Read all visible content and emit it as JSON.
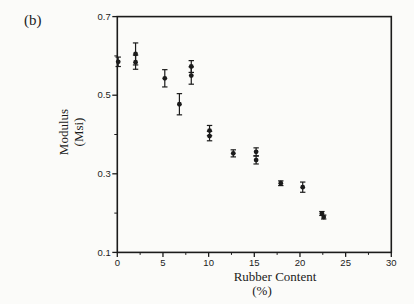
{
  "figure": {
    "panel_label": "(b)",
    "background": "#fbfbf9",
    "ink": "#1b1b1b"
  },
  "chart_data": {
    "type": "scatter",
    "title": "",
    "xlabel_line1": "Rubber Content",
    "xlabel_line2": "(%)",
    "ylabel_line1": "Modulus",
    "ylabel_line2": "(Msi)",
    "xlim": [
      0,
      30
    ],
    "ylim": [
      0.1,
      0.7
    ],
    "grid": false,
    "legend": null,
    "marker": "filled-circle",
    "error_bars": "vertical-with-caps",
    "x_major_ticks": [
      0,
      5,
      10,
      15,
      20,
      25,
      30
    ],
    "x_tick_labels": [
      "0",
      "5",
      "10",
      "15",
      "20",
      "25",
      "30"
    ],
    "x_minor_ticks": [
      2.5,
      7.5,
      12.5,
      17.5,
      22.5,
      27.5
    ],
    "y_major_ticks": [
      0.7,
      0.5,
      0.3,
      0.1
    ],
    "y_tick_labels": [
      "0.7",
      "0.5",
      "0.3",
      "0.1"
    ],
    "y_minor_ticks": [
      0.6,
      0.4,
      0.2
    ],
    "points": [
      {
        "x": 0.1,
        "y": 0.585,
        "yerr": 0.012
      },
      {
        "x": 2.0,
        "y": 0.605,
        "yerr": 0.028
      },
      {
        "x": 2.0,
        "y": 0.584,
        "yerr": 0.018
      },
      {
        "x": 5.2,
        "y": 0.543,
        "yerr": 0.022
      },
      {
        "x": 6.8,
        "y": 0.477,
        "yerr": 0.027
      },
      {
        "x": 8.1,
        "y": 0.573,
        "yerr": 0.015
      },
      {
        "x": 8.1,
        "y": 0.55,
        "yerr": 0.022
      },
      {
        "x": 10.1,
        "y": 0.41,
        "yerr": 0.013
      },
      {
        "x": 10.1,
        "y": 0.396,
        "yerr": 0.012
      },
      {
        "x": 12.7,
        "y": 0.352,
        "yerr": 0.009
      },
      {
        "x": 15.2,
        "y": 0.356,
        "yerr": 0.01
      },
      {
        "x": 15.2,
        "y": 0.335,
        "yerr": 0.01
      },
      {
        "x": 17.9,
        "y": 0.276,
        "yerr": 0.006
      },
      {
        "x": 20.3,
        "y": 0.266,
        "yerr": 0.013
      },
      {
        "x": 22.4,
        "y": 0.199,
        "yerr": 0.005
      },
      {
        "x": 22.6,
        "y": 0.19,
        "yerr": 0.005
      }
    ]
  }
}
